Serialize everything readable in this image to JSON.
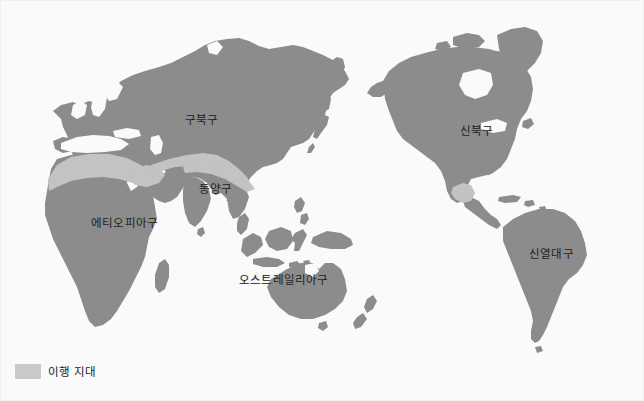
{
  "figure": {
    "kind": "world-biogeographic-realms-map",
    "background_color": "#fafafa",
    "border_color": "#f0f0f0",
    "width": 644,
    "height": 401
  },
  "colors": {
    "land_realm": "#8c8c8c",
    "transition_zone": "#c3c3c3",
    "ocean": "#fafafa",
    "label_text": "#1c1c1c"
  },
  "map": {
    "labels": [
      {
        "id": "palearctic",
        "text": "구북구",
        "x": 184,
        "y": 110
      },
      {
        "id": "nearctic",
        "text": "신북구",
        "x": 459,
        "y": 121
      },
      {
        "id": "oriental",
        "text": "동양구",
        "x": 198,
        "y": 179
      },
      {
        "id": "ethiopian",
        "text": "에티오피아구",
        "x": 90,
        "y": 213
      },
      {
        "id": "australian",
        "text": "오스트레일리아구",
        "x": 238,
        "y": 270
      },
      {
        "id": "neotropical",
        "text": "신열대구",
        "x": 528,
        "y": 244
      }
    ]
  },
  "legend": {
    "swatch_color": "#c9c9c9",
    "label": "이행 지대"
  }
}
